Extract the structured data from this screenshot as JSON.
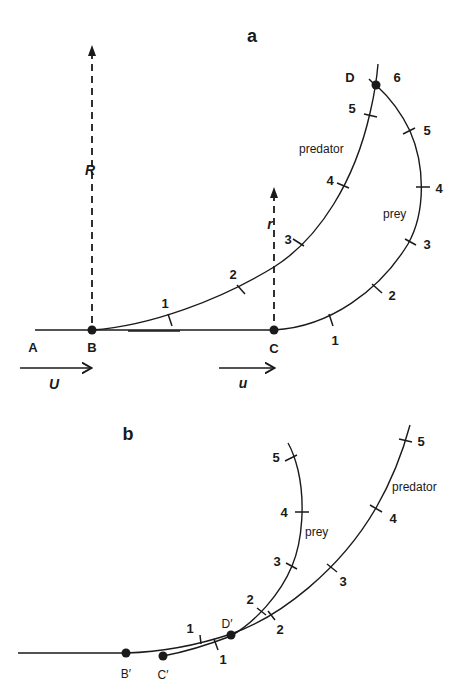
{
  "panel_a": {
    "label": "a",
    "points": {
      "A": "A",
      "B": "B",
      "C": "C",
      "D": "D"
    },
    "predator_label": "predator",
    "prey_label": "prey",
    "predator_range_label": "R",
    "prey_range_label": "r",
    "predator_speed_label": "U",
    "prey_speed_label": "u",
    "predator_ticks": [
      "1",
      "2",
      "3",
      "4",
      "5",
      "6"
    ],
    "prey_ticks": [
      "1",
      "2",
      "3",
      "4",
      "5"
    ]
  },
  "panel_b": {
    "label": "b",
    "points": {
      "B": "B′",
      "C": "C′",
      "D": "D′"
    },
    "predator_label": "predator",
    "prey_label": "prey",
    "predator_ticks": [
      "1",
      "2",
      "3",
      "4",
      "5"
    ],
    "prey_ticks": [
      "1",
      "2",
      "3",
      "4",
      "5"
    ]
  }
}
